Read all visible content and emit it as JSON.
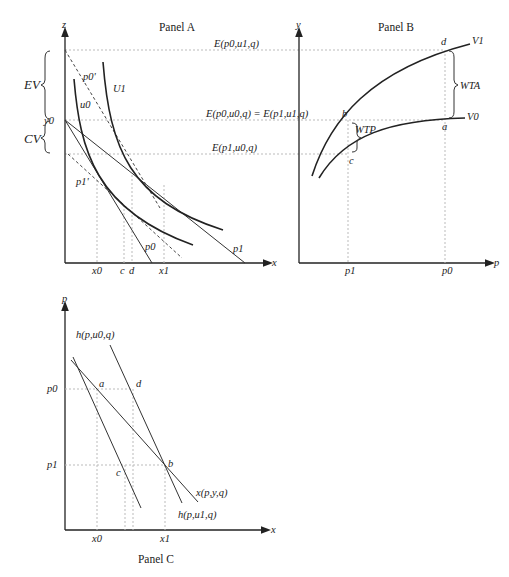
{
  "panel_a": {
    "title": "Panel A",
    "y_axis": "z",
    "x_axis": "x",
    "y0": "y0",
    "ev": "EV",
    "cv": "CV",
    "p0_prime": "p0'",
    "p1_prime": "p1'",
    "u0": "u0",
    "u1": "U1",
    "p0": "p0",
    "p1": "p1",
    "x0": "x0",
    "c": "c",
    "d": "d",
    "x1": "x1",
    "e_top": "E(p0,u1,q)",
    "e_mid": "E(p0,u0,q) = E(p1,u1,q)",
    "e_low": "E(p1,u0,q)"
  },
  "panel_b": {
    "title": "Panel B",
    "y_axis": "y",
    "x_axis": "p",
    "v1": "V1",
    "v0": "V0",
    "wta": "WTA",
    "wtp": "WTP",
    "a": "a",
    "b": "b",
    "c": "c",
    "d": "d",
    "p1": "p1",
    "p0": "p0"
  },
  "panel_c": {
    "title": "Panel C",
    "y_axis": "p",
    "x_axis": "x",
    "h_u0": "h(p,u0,q)",
    "h_u1": "h(p,u1,q)",
    "x_pyq": "x(p,y,q)",
    "p0": "p0",
    "p1": "p1",
    "a": "a",
    "b": "b",
    "c": "c",
    "d": "d",
    "x0": "x0",
    "x1": "x1"
  }
}
